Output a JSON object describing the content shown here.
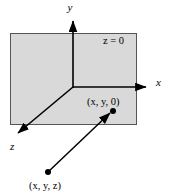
{
  "figure": {
    "type": "3d-coordinate-diagram",
    "background_color": "#ffffff",
    "plane": {
      "label": "z = 0",
      "fill_color": "#d9d9d9",
      "stroke_color": "#4d4d4d",
      "x": 10,
      "y": 33,
      "width": 127,
      "height": 92
    },
    "origin": {
      "x": 73,
      "y": 87
    },
    "axes": [
      {
        "name": "y-axis",
        "label": "y",
        "label_x": 70,
        "label_y": 11,
        "from": [
          73,
          87
        ],
        "to": [
          73,
          17
        ],
        "color": "#000000"
      },
      {
        "name": "x-axis",
        "label": "x",
        "label_x": 156,
        "label_y": 86,
        "from": [
          73,
          87
        ],
        "to": [
          150,
          87
        ],
        "color": "#000000"
      },
      {
        "name": "z-axis",
        "label": "z",
        "label_x": 11,
        "label_y": 150,
        "from": [
          73,
          87
        ],
        "to": [
          14,
          136
        ],
        "color": "#000000"
      }
    ],
    "points": [
      {
        "name": "point-xy0",
        "label": "(x, y, 0)",
        "dot_x": 113,
        "dot_y": 111,
        "label_x": 87,
        "label_y": 105,
        "color": "#000000"
      },
      {
        "name": "point-xyz",
        "label": "(x, y, z)",
        "dot_x": 48,
        "dot_y": 172,
        "label_x": 29,
        "label_y": 189,
        "color": "#000000"
      }
    ],
    "vector": {
      "name": "projection-vector",
      "from": [
        48,
        172
      ],
      "to": [
        106,
        116
      ],
      "color": "#000000"
    }
  }
}
